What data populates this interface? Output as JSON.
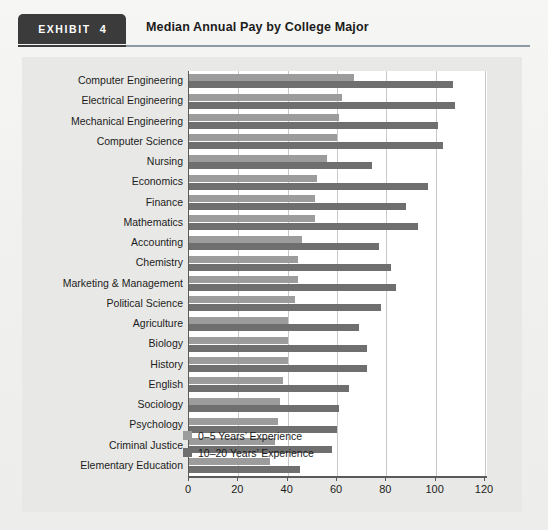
{
  "header": {
    "exhibit_label": "EXHIBIT",
    "exhibit_number": "4",
    "title": "Median Annual Pay by College Major"
  },
  "colors": {
    "series_light": "#9c9c9c",
    "series_dark": "#6f6f6f",
    "panel_bg": "#e8e8e6",
    "plot_bg": "#ffffff",
    "axis": "#5a5a5a",
    "gridline": "#c9c9c9",
    "tab_bg": "#3b3b3b",
    "rule": "#8e9aa3"
  },
  "chart_data": {
    "type": "bar",
    "orientation": "horizontal",
    "title": "Median Annual Pay by College Major",
    "xlabel": "",
    "ylabel": "",
    "xlim": [
      0,
      120
    ],
    "xticks": [
      0,
      20,
      40,
      60,
      80,
      100,
      120
    ],
    "xtick_labels": [
      "0",
      "20",
      "40",
      "60",
      "80",
      "100",
      "120"
    ],
    "grid": true,
    "legend_position": "inside-lower-right",
    "units_note": "thousands of US dollars",
    "categories": [
      "Computer Engineering",
      "Electrical Engineering",
      "Mechanical Engineering",
      "Computer Science",
      "Nursing",
      "Economics",
      "Finance",
      "Mathematics",
      "Accounting",
      "Chemistry",
      "Marketing & Management",
      "Political Science",
      "Agriculture",
      "Biology",
      "History",
      "English",
      "Sociology",
      "Psychology",
      "Criminal Justice",
      "Elementary Education"
    ],
    "series": [
      {
        "name": "0–5 Years’  Experience",
        "color": "#9c9c9c",
        "values": [
          67,
          62,
          61,
          60,
          56,
          52,
          51,
          51,
          46,
          44,
          44,
          43,
          40,
          40,
          40,
          38,
          37,
          36,
          35,
          33
        ]
      },
      {
        "name": "10–20 Years’  Experience",
        "color": "#6f6f6f",
        "values": [
          107,
          108,
          101,
          103,
          74,
          97,
          88,
          93,
          77,
          82,
          84,
          78,
          69,
          72,
          72,
          65,
          61,
          60,
          58,
          45
        ]
      }
    ]
  }
}
